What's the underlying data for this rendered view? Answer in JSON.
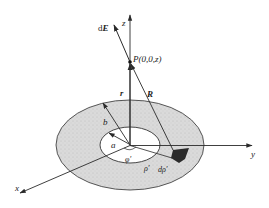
{
  "diagram": {
    "type": "physics-field-diagram",
    "colors": {
      "line": "#2a2a2a",
      "annulus_fill": "#d9d9d9",
      "inner_fill": "#ffffff",
      "patch_fill": "#2b2b2b"
    },
    "labels": {
      "z_axis": "z",
      "y_axis": "y",
      "x_axis": "x",
      "field_element": "dE",
      "field_element_d": "d",
      "field_element_E": "E",
      "point": "P(0,0,z)",
      "r_vector": "r",
      "R_vector": "R",
      "outer_radius": "b",
      "inner_radius": "a",
      "azimuth": "φ′",
      "radial_coord": "ρ′",
      "radial_increment": "dρ′"
    }
  }
}
